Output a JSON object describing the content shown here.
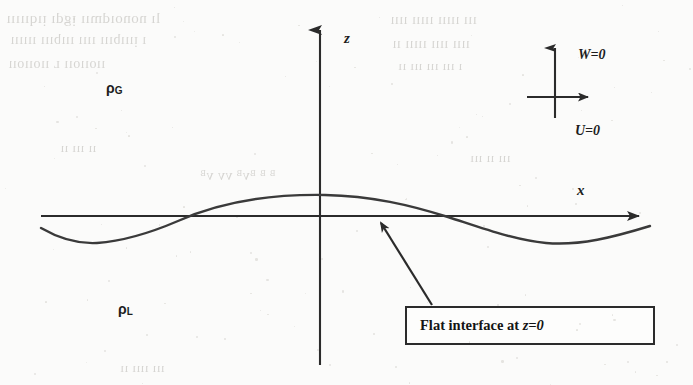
{
  "figure": {
    "background_color": "#fbfbfa",
    "ink_color": "#2b2b2b",
    "axes": {
      "z_axis_label": "z",
      "x_axis_label": "x"
    },
    "density_labels": {
      "gas": {
        "symbol": "ρ",
        "subscript": "G"
      },
      "liquid": {
        "symbol": "ρ",
        "subscript": "L"
      }
    },
    "velocity_legend": {
      "vertical_label": "W=0",
      "horizontal_label": "U=0"
    },
    "callout": {
      "text_prefix": "Flat interface at ",
      "text_math": "z=0"
    },
    "ghost_text": [
      {
        "text": "lı nonoıdmıı ᴉgdı ᴉıqııııı",
        "left": 6,
        "top": 10,
        "size": 15
      },
      {
        "text": "ı ᴉıııbııı ıııı ıııbııı ıııııı",
        "left": 10,
        "top": 32,
        "size": 14
      },
      {
        "text": "ııoııoıı ʟ ııoııoıı",
        "left": 8,
        "top": 56,
        "size": 14
      },
      {
        "text": "ııı ııııı ııııı ıııı",
        "left": 390,
        "top": 12,
        "size": 14
      },
      {
        "text": "ıııı ıııı ııııı ıı",
        "left": 392,
        "top": 36,
        "size": 14
      },
      {
        "text": "ı ııı ııı ııı ıı",
        "left": 398,
        "top": 58,
        "size": 13
      },
      {
        "text": "ᴮ ᴮ ᴮᴠᴮ ᴠᴠ ᴠᴮ",
        "left": 200,
        "top": 168,
        "size": 14
      },
      {
        "text": "ıı ııı ıı",
        "left": 60,
        "top": 140,
        "size": 13
      },
      {
        "text": "ııı ıı ııı",
        "left": 470,
        "top": 150,
        "size": 13
      },
      {
        "text": "ııı ıııı ıı",
        "left": 120,
        "top": 360,
        "size": 13
      }
    ]
  },
  "chart_data": {
    "type": "line",
    "title": "",
    "xlabel": "x",
    "ylabel": "z",
    "grid": false,
    "legend_position": "none",
    "series": [
      {
        "name": "interface",
        "form": "z = a*cos(k*x)",
        "comment": "one full wavelength drawn across the domain; crest at x=0 on the z-axis",
        "x": [
          41,
          68,
          95,
          122,
          150,
          180,
          210,
          240,
          270,
          295,
          325,
          355,
          385,
          415,
          445,
          475,
          505,
          545,
          585,
          615,
          650
        ],
        "z": [
          228,
          238,
          243,
          241,
          235,
          228,
          219,
          210,
          202,
          197,
          195,
          197,
          201,
          207,
          215,
          224,
          233,
          243,
          241,
          234,
          226
        ]
      }
    ],
    "annotations": [
      {
        "label": "ρG",
        "x": 118,
        "y": 89,
        "meaning": "gas density, region above interface"
      },
      {
        "label": "ρL",
        "x": 130,
        "y": 310,
        "meaning": "liquid density, region below interface"
      },
      {
        "label": "W=0",
        "x": 580,
        "y": 57,
        "meaning": "vertical velocity component is zero"
      },
      {
        "label": "U=0",
        "x": 577,
        "y": 132,
        "meaning": "horizontal velocity component is zero"
      },
      {
        "label": "Flat interface at z=0",
        "x": 418,
        "y": 315,
        "meaning": "callout pointing to undisturbed interface level"
      }
    ],
    "axis_origin": {
      "x": 320,
      "z": 216
    },
    "xlim": [
      41,
      650
    ],
    "ylim": [
      365,
      22
    ]
  }
}
